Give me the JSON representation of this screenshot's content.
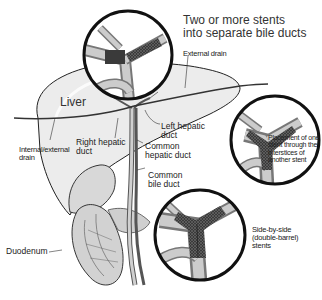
{
  "diagram": {
    "title_line1": "Two or more stents",
    "title_line2": "into separate bile ducts",
    "labels": {
      "external_drain": "External drain",
      "liver": "Liver",
      "internal_external_drain_1": "Internal/external",
      "internal_external_drain_2": "drain",
      "right_hepatic_duct_1": "Right hepatic",
      "right_hepatic_duct_2": "duct",
      "left_hepatic_duct_1": "Left hepatic",
      "left_hepatic_duct_2": "duct",
      "common_hepatic_duct_1": "Common",
      "common_hepatic_duct_2": "hepatic duct",
      "common_bile_duct_1": "Common",
      "common_bile_duct_2": "bile duct",
      "duodenum": "Duodenum",
      "placement_1": "Placement of one",
      "placement_2": "stent through the",
      "placement_3": "interstices of",
      "placement_4": "another stent",
      "side_by_side_1": "Side-by-side",
      "side_by_side_2": "(double-barrel)",
      "side_by_side_3": "stents"
    },
    "insets": [
      {
        "name": "separate-stents-inset",
        "caption": "Two or more stents into separate bile ducts"
      },
      {
        "name": "stent-through-interstices-inset",
        "caption": "Placement of one stent through the interstices of another stent"
      },
      {
        "name": "side-by-side-stents-inset",
        "caption": "Side-by-side (double-barrel) stents"
      }
    ],
    "colors": {
      "outline": "#111111",
      "liver_fill": "#ececec",
      "duct_fill": "#bdbdbd",
      "stent_fill": "#4a4a4a"
    }
  }
}
